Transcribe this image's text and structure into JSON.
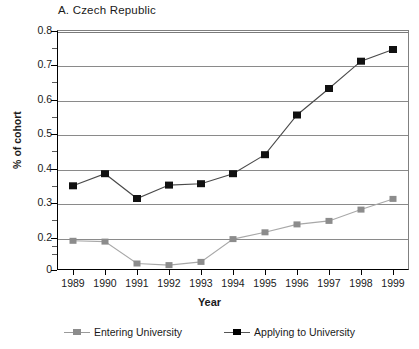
{
  "chart_data": {
    "type": "line",
    "title": "A.  Czech Republic",
    "xlabel": "Year",
    "ylabel": "% of cohort",
    "categories": [
      "1989",
      "1990",
      "1991",
      "1992",
      "1993",
      "1994",
      "1995",
      "1996",
      "1997",
      "1998",
      "1999"
    ],
    "x": [
      1989,
      1990,
      1991,
      1992,
      1993,
      1994,
      1995,
      1996,
      1997,
      1998,
      1999
    ],
    "ylim": [
      0,
      0.8
    ],
    "ytick_labels": [
      "0",
      "0.2",
      "0.3",
      "0.4",
      "0.5",
      "0.6",
      "0.7",
      "0.8"
    ],
    "ytick_values": [
      0,
      0.2,
      0.3,
      0.4,
      0.5,
      0.6,
      0.7,
      0.8
    ],
    "yminor_values": [
      0.1,
      0.15,
      0.25,
      0.35,
      0.45,
      0.55,
      0.65,
      0.75
    ],
    "grid": "horizontal",
    "legend_position": "bottom",
    "series": [
      {
        "name": "Entering University",
        "color": "#808080",
        "marker": "square",
        "values": [
          0.18,
          0.175,
          0.04,
          0.03,
          0.05,
          0.19,
          0.215,
          0.238,
          0.248,
          0.281,
          0.312
        ]
      },
      {
        "name": "Applying to University",
        "color": "#000000",
        "marker": "square",
        "values": [
          0.35,
          0.385,
          0.313,
          0.352,
          0.356,
          0.385,
          0.44,
          0.555,
          0.632,
          0.711,
          0.745
        ]
      }
    ]
  },
  "legend": {
    "items": [
      {
        "label": "Entering University"
      },
      {
        "label": "Applying to University"
      }
    ]
  },
  "colors": {
    "entering": "#808080",
    "applying": "#000000",
    "grid": "#8a8a8a",
    "axis": "#000000",
    "background": "#ffffff"
  }
}
